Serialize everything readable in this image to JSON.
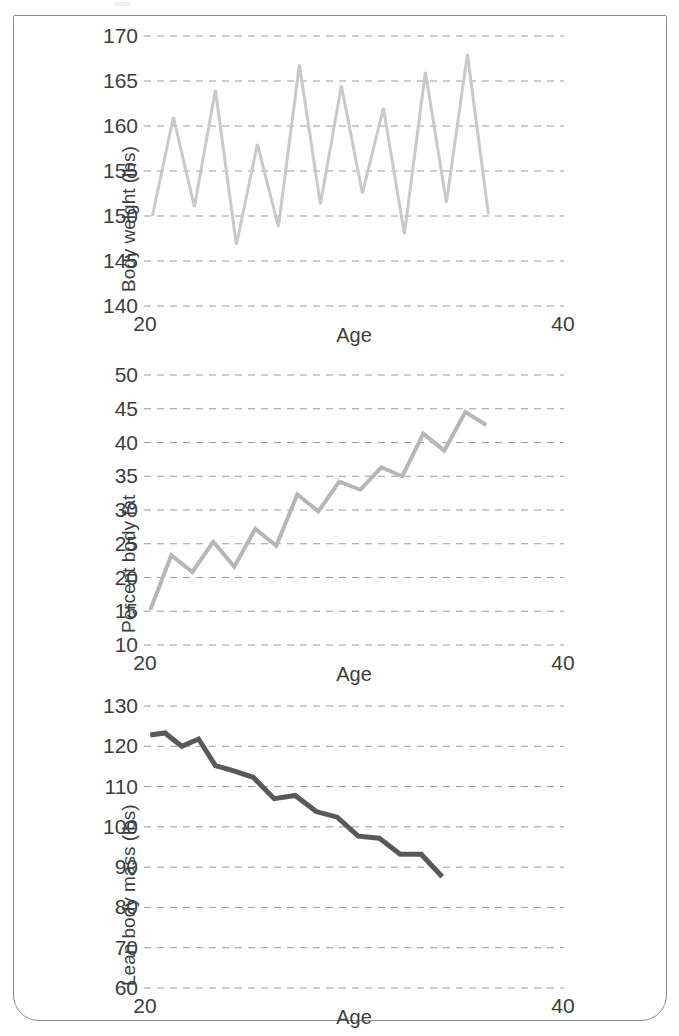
{
  "figure": {
    "border_color": "#8a8a8a",
    "background": "#ffffff",
    "panel_count": 3
  },
  "chart_data": [
    {
      "type": "line",
      "title": "",
      "xlabel": "Age",
      "ylabel": "Body weight (lbs)",
      "xlim": [
        20,
        40
      ],
      "ylim": [
        140,
        170
      ],
      "xticks": [
        20,
        40
      ],
      "xticklabels": [
        "20",
        "40"
      ],
      "yticks": [
        140,
        145,
        150,
        155,
        160,
        165,
        170
      ],
      "yticklabels": [
        "140",
        "145",
        "150",
        "155",
        "160",
        "165",
        "170"
      ],
      "grid": "horizontal-dashed",
      "line_color": "#c9c9c9",
      "line_width": 3,
      "legend": "none",
      "x": [
        20.4,
        21.4,
        22.4,
        23.4,
        24.4,
        25.4,
        26.4,
        27.4,
        28.4,
        29.4,
        30.4,
        31.4,
        32.4,
        33.4,
        34.4,
        35.4,
        36.4,
        37.4,
        38.4,
        39.2
      ],
      "y": [
        150.0,
        161.0,
        151.0,
        164.0,
        146.8,
        158.0,
        148.8,
        166.8,
        151.3,
        164.5,
        152.5,
        162.0,
        148.0,
        166.0,
        151.5,
        168.0,
        150.2,
        150.2,
        150.2,
        150.2
      ],
      "values": [
        150.0,
        161.0,
        151.0,
        164.0,
        146.8,
        158.0,
        148.8,
        166.8,
        151.3,
        164.5,
        152.5,
        162.0,
        148.0,
        166.0,
        151.5,
        168.0,
        150.2
      ]
    },
    {
      "type": "line",
      "title": "",
      "xlabel": "Age",
      "ylabel": "Percent body fat",
      "xlim": [
        20,
        40
      ],
      "ylim": [
        10,
        50
      ],
      "xticks": [
        20,
        40
      ],
      "xticklabels": [
        "20",
        "40"
      ],
      "yticks": [
        10,
        15,
        20,
        25,
        30,
        35,
        40,
        45,
        50
      ],
      "yticklabels": [
        "10",
        "15",
        "20",
        "25",
        "30",
        "35",
        "40",
        "45",
        "50"
      ],
      "grid": "horizontal-dashed",
      "line_color": "#b6b6b6",
      "line_width": 4,
      "legend": "none",
      "x": [
        20.3,
        21.3,
        22.3,
        23.3,
        24.3,
        25.3,
        26.3,
        27.3,
        28.3,
        29.3,
        30.3,
        31.3,
        32.3,
        33.3,
        34.3,
        35.3,
        36.3,
        37.3,
        38.3
      ],
      "values": [
        15.2,
        23.3,
        20.8,
        25.3,
        21.6,
        27.2,
        24.7,
        32.3,
        29.8,
        34.2,
        33.0,
        36.3,
        35.0,
        41.3,
        38.8,
        44.5,
        42.6
      ]
    },
    {
      "type": "line",
      "title": "",
      "xlabel": "Age",
      "ylabel": "Lean body mass (lbs)",
      "xlim": [
        20,
        40
      ],
      "ylim": [
        60,
        130
      ],
      "xticks": [
        20,
        40
      ],
      "xticklabels": [
        "20",
        "40"
      ],
      "yticks": [
        60,
        70,
        80,
        90,
        100,
        110,
        120,
        130
      ],
      "yticklabels": [
        "60",
        "70",
        "80",
        "90",
        "100",
        "110",
        "120",
        "130"
      ],
      "grid": "horizontal-dashed",
      "line_color": "#595959",
      "line_width": 5,
      "legend": "none",
      "x": [
        20.3,
        21.0,
        21.8,
        22.6,
        23.4,
        24.2,
        25.2,
        26.2,
        27.2,
        28.2,
        29.2,
        30.2,
        31.2,
        32.2,
        33.2,
        34.2,
        35.4,
        36.6,
        37.8,
        38.6
      ],
      "values": [
        122.8,
        123.3,
        120.0,
        121.8,
        115.2,
        114.0,
        112.3,
        107.0,
        107.8,
        103.8,
        102.4,
        97.7,
        97.2,
        93.2,
        93.2,
        87.6
      ]
    }
  ],
  "panels": [
    {
      "ylabel": "Body weight (lbs)",
      "xlabel": "Age",
      "xtick_left": "20",
      "xtick_right": "40",
      "yticklabels": [
        "170",
        "165",
        "160",
        "155",
        "150",
        "145",
        "140"
      ]
    },
    {
      "ylabel": "Percent body fat",
      "xlabel": "Age",
      "xtick_left": "20",
      "xtick_right": "40",
      "yticklabels": [
        "50",
        "45",
        "40",
        "35",
        "30",
        "25",
        "20",
        "15",
        "10"
      ]
    },
    {
      "ylabel": "Lean body mass (lbs)",
      "xlabel": "Age",
      "xtick_left": "20",
      "xtick_right": "40",
      "yticklabels": [
        "130",
        "120",
        "110",
        "100",
        "90",
        "80",
        "70",
        "60"
      ]
    }
  ]
}
